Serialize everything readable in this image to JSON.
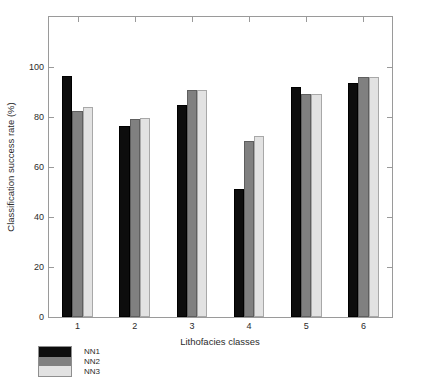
{
  "chart_data": {
    "type": "bar",
    "title": "",
    "xlabel": "Lithofacies classes",
    "ylabel": "Classification success rate (%)",
    "categories": [
      "1",
      "2",
      "3",
      "4",
      "5",
      "6"
    ],
    "series": [
      {
        "name": "NN1",
        "color": "#0d0d0d",
        "values": [
          96.3,
          76.6,
          85.0,
          51.4,
          92.1,
          93.7
        ]
      },
      {
        "name": "NN2",
        "color": "#808080",
        "values": [
          82.3,
          79.4,
          90.8,
          70.5,
          89.3,
          96.2
        ]
      },
      {
        "name": "NN3",
        "color": "#e2e2e2",
        "values": [
          84.2,
          79.6,
          90.8,
          72.5,
          89.3,
          96.2
        ]
      }
    ],
    "ylim": [
      0,
      120
    ],
    "yticks": [
      0,
      20,
      40,
      60,
      80,
      100
    ],
    "ytick_labels": [
      "0",
      "20",
      "40",
      "60",
      "80",
      "100"
    ],
    "xtick_labels": [
      "1",
      "2",
      "3",
      "4",
      "5",
      "6"
    ],
    "grid": false,
    "legend_position": "below-plot-left",
    "legend_entries": [
      "NN1",
      "NN2",
      "NN3"
    ]
  },
  "figure": {
    "background": "#ffffff",
    "axis_color": "#9a9a9a",
    "text_color": "#2b2b2b"
  }
}
